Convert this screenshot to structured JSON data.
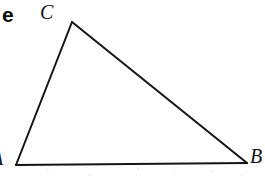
{
  "figure": {
    "kind": "geometry-diagram",
    "background_color": "#ffffff",
    "ink_color": "#111111",
    "stroke_width": 2
  },
  "text_fragment": {
    "label": "e",
    "note": "clipped trailing letter of a cut-off word at the left page edge"
  },
  "triangle": {
    "stroke_color": "#141414",
    "vertices": [
      {
        "name": "A",
        "label": "A",
        "x": 16,
        "y": 165,
        "label_x": -9,
        "label_y": 148,
        "clipped": "left"
      },
      {
        "name": "B",
        "label": "B",
        "x": 247,
        "y": 163,
        "label_x": 250,
        "label_y": 146,
        "clipped": "right"
      },
      {
        "name": "C",
        "label": "C",
        "x": 72,
        "y": 22,
        "label_x": 40,
        "label_y": 2,
        "clipped": "none"
      }
    ],
    "edges": [
      {
        "name": "AC",
        "from": "A",
        "to": "C"
      },
      {
        "name": "CB",
        "from": "C",
        "to": "B"
      },
      {
        "name": "AB",
        "from": "A",
        "to": "B"
      }
    ]
  }
}
